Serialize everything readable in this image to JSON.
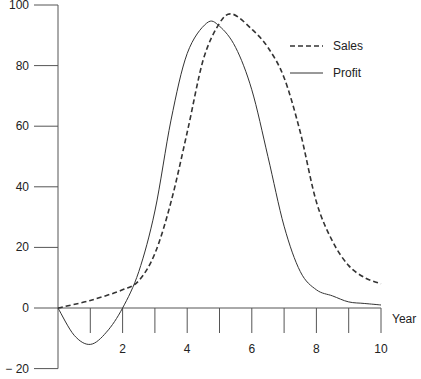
{
  "chart_data": {
    "type": "line",
    "title": "",
    "xlabel": "Year",
    "ylabel": "",
    "xlim": [
      0,
      10
    ],
    "ylim": [
      -20,
      100
    ],
    "grid": false,
    "legend_position": "upper right",
    "x_ticks": [
      1,
      2,
      3,
      4,
      5,
      6,
      7,
      8,
      9,
      10
    ],
    "x_tick_labels": [
      {
        "x": 2,
        "label": "2"
      },
      {
        "x": 4,
        "label": "4"
      },
      {
        "x": 6,
        "label": "6"
      },
      {
        "x": 8,
        "label": "8"
      },
      {
        "x": 10,
        "label": "10"
      }
    ],
    "y_ticks": [
      {
        "y": 100,
        "label": "100"
      },
      {
        "y": 80,
        "label": "80"
      },
      {
        "y": 60,
        "label": "60"
      },
      {
        "y": 40,
        "label": "40"
      },
      {
        "y": 20,
        "label": "20"
      },
      {
        "y": 0,
        "label": "0"
      },
      {
        "y": -20,
        "label": "− 20"
      }
    ],
    "series": [
      {
        "name": "Sales",
        "style": "dashed",
        "x": [
          0,
          1,
          2,
          2.5,
          3,
          3.5,
          4,
          4.5,
          5,
          5.4,
          6,
          6.5,
          7,
          7.5,
          8,
          8.5,
          9,
          9.5,
          10
        ],
        "values": [
          0,
          2.5,
          6,
          9,
          18,
          35,
          58,
          82,
          94,
          97,
          92,
          86,
          76,
          58,
          35,
          22,
          14,
          10,
          8
        ]
      },
      {
        "name": "Profit",
        "style": "solid",
        "x": [
          0,
          0.5,
          1,
          1.5,
          2,
          2.5,
          3,
          3.5,
          4,
          4.6,
          5,
          5.5,
          6,
          6.5,
          7,
          7.5,
          8,
          8.5,
          9,
          9.5,
          10
        ],
        "values": [
          0,
          -9,
          -12,
          -8,
          0,
          12,
          32,
          62,
          84,
          94,
          93,
          86,
          72,
          50,
          27,
          12,
          6,
          4,
          2,
          1.5,
          1
        ]
      }
    ],
    "legend": [
      {
        "name": "Sales",
        "style": "dashed"
      },
      {
        "name": "Profit",
        "style": "solid"
      }
    ]
  },
  "colors": {
    "axis": "#555555",
    "line": "#333333",
    "text": "#222222",
    "background": "#ffffff"
  }
}
